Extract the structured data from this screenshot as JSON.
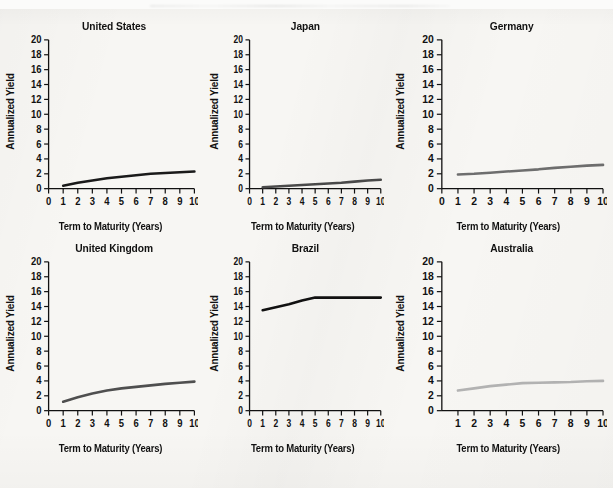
{
  "figure": {
    "background_color": "#f7f6f3",
    "axis_color": "#111111",
    "panel_count": 6,
    "layout": "2 rows x 3 columns"
  },
  "common": {
    "xlabel": "Term to Maturity (Years)",
    "ylabel": "Annualized Yield",
    "y_ticks": [
      "0",
      "2",
      "4",
      "6",
      "8",
      "10",
      "12",
      "14",
      "16",
      "18",
      "20"
    ],
    "x_ticks": [
      "0",
      "1",
      "2",
      "3",
      "4",
      "5",
      "6",
      "7",
      "8",
      "9",
      "10"
    ],
    "x_ticks_no_zero": [
      "1",
      "2",
      "3",
      "4",
      "5",
      "6",
      "7",
      "8",
      "9",
      "10"
    ]
  },
  "chart_data": [
    {
      "type": "line",
      "title": "United States",
      "xlabel": "Term to Maturity (Years)",
      "ylabel": "Annualized Yield",
      "xlim": [
        0,
        10
      ],
      "ylim": [
        0,
        20
      ],
      "xticks": [
        0,
        1,
        2,
        3,
        4,
        5,
        6,
        7,
        8,
        9,
        10
      ],
      "yticks": [
        0,
        2,
        4,
        6,
        8,
        10,
        12,
        14,
        16,
        18,
        20
      ],
      "grid": false,
      "legend": "none",
      "line_color": "#1a1a1a",
      "x": [
        1,
        2,
        3,
        4,
        5,
        6,
        7,
        8,
        9,
        10
      ],
      "values": [
        0.4,
        0.8,
        1.1,
        1.4,
        1.6,
        1.8,
        2.0,
        2.1,
        2.2,
        2.3
      ]
    },
    {
      "type": "line",
      "title": "Japan",
      "xlabel": "Term to Maturity (Years)",
      "ylabel": "Annualized Yield",
      "xlim": [
        0,
        10
      ],
      "ylim": [
        0,
        20
      ],
      "xticks": [
        0,
        1,
        2,
        3,
        4,
        5,
        6,
        7,
        8,
        9,
        10
      ],
      "yticks": [
        0,
        2,
        4,
        6,
        8,
        10,
        12,
        14,
        16,
        18,
        20
      ],
      "grid": false,
      "legend": "none",
      "line_color": "#4a4a4a",
      "x": [
        1,
        2,
        3,
        4,
        5,
        6,
        7,
        8,
        9,
        10
      ],
      "values": [
        0.2,
        0.3,
        0.4,
        0.5,
        0.6,
        0.7,
        0.8,
        0.95,
        1.1,
        1.2
      ]
    },
    {
      "type": "line",
      "title": "Germany",
      "xlabel": "Term to Maturity (Years)",
      "ylabel": "Annualized Yield",
      "xlim": [
        0,
        10
      ],
      "ylim": [
        0,
        20
      ],
      "xticks": [
        0,
        1,
        2,
        3,
        4,
        5,
        6,
        7,
        8,
        9,
        10
      ],
      "yticks": [
        0,
        2,
        4,
        6,
        8,
        10,
        12,
        14,
        16,
        18,
        20
      ],
      "grid": false,
      "legend": "none",
      "line_color": "#6e6e6e",
      "x": [
        1,
        2,
        3,
        4,
        5,
        6,
        7,
        8,
        9,
        10
      ],
      "values": [
        1.9,
        2.0,
        2.15,
        2.3,
        2.45,
        2.6,
        2.8,
        2.95,
        3.1,
        3.2
      ]
    },
    {
      "type": "line",
      "title": "United Kingdom",
      "xlabel": "Term to Maturity (Years)",
      "ylabel": "Annualized Yield",
      "xlim": [
        0,
        10
      ],
      "ylim": [
        0,
        20
      ],
      "xticks": [
        0,
        1,
        2,
        3,
        4,
        5,
        6,
        7,
        8,
        9,
        10
      ],
      "yticks": [
        0,
        2,
        4,
        6,
        8,
        10,
        12,
        14,
        16,
        18,
        20
      ],
      "grid": false,
      "legend": "none",
      "line_color": "#4f4f4f",
      "x": [
        1,
        2,
        3,
        4,
        5,
        6,
        7,
        8,
        9,
        10
      ],
      "values": [
        1.2,
        1.8,
        2.3,
        2.7,
        3.0,
        3.2,
        3.4,
        3.6,
        3.75,
        3.9
      ]
    },
    {
      "type": "line",
      "title": "Brazil",
      "xlabel": "Term to Maturity (Years)",
      "ylabel": "Annualized Yield",
      "xlim": [
        0,
        10
      ],
      "ylim": [
        0,
        20
      ],
      "xticks": [
        0,
        1,
        2,
        3,
        4,
        5,
        6,
        7,
        8,
        9,
        10
      ],
      "yticks": [
        0,
        2,
        4,
        6,
        8,
        10,
        12,
        14,
        16,
        18,
        20
      ],
      "grid": false,
      "legend": "none",
      "line_color": "#111111",
      "x": [
        1,
        2,
        3,
        4,
        5,
        6,
        7,
        8,
        9,
        10
      ],
      "values": [
        13.5,
        13.9,
        14.3,
        14.8,
        15.2,
        15.2,
        15.2,
        15.2,
        15.2,
        15.2
      ]
    },
    {
      "type": "line",
      "title": "Australia",
      "xlabel": "Term to Maturity (Years)",
      "ylabel": "Annualized Yield",
      "xlim": [
        0,
        10
      ],
      "ylim": [
        0,
        20
      ],
      "xticks": [
        1,
        2,
        3,
        4,
        5,
        6,
        7,
        8,
        9,
        10
      ],
      "yticks": [
        0,
        2,
        4,
        6,
        8,
        10,
        12,
        14,
        16,
        18,
        20
      ],
      "grid": false,
      "legend": "none",
      "line_color": "#b3b3b3",
      "x": [
        1,
        2,
        3,
        4,
        5,
        6,
        7,
        8,
        9,
        10
      ],
      "values": [
        2.7,
        3.0,
        3.3,
        3.5,
        3.7,
        3.75,
        3.8,
        3.85,
        3.95,
        4.0
      ]
    }
  ]
}
